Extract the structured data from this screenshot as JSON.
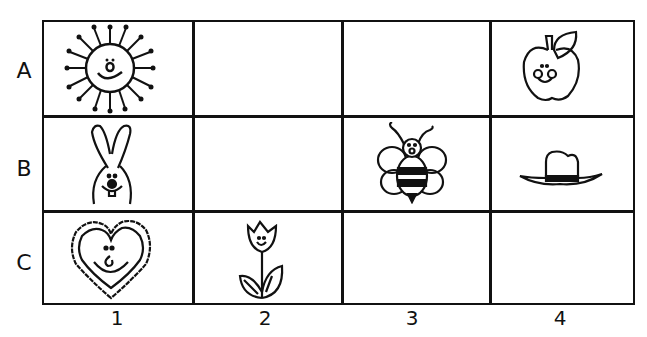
{
  "rows": [
    "A",
    "B",
    "C"
  ],
  "columns": [
    "1",
    "2",
    "3",
    "4"
  ],
  "cells": [
    {
      "row": "A",
      "col": "1",
      "item": "sun"
    },
    {
      "row": "A",
      "col": "4",
      "item": "apple"
    },
    {
      "row": "B",
      "col": "1",
      "item": "bunny"
    },
    {
      "row": "B",
      "col": "3",
      "item": "bee"
    },
    {
      "row": "B",
      "col": "4",
      "item": "cowboy-hat"
    },
    {
      "row": "C",
      "col": "1",
      "item": "heart"
    },
    {
      "row": "C",
      "col": "2",
      "item": "tulip"
    }
  ]
}
